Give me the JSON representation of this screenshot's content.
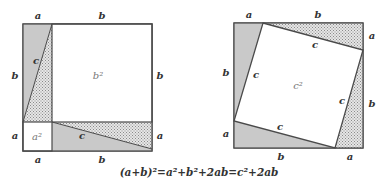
{
  "colors": {
    "stroke": "#4a4a4a",
    "solid_fill": "#c9c9c9",
    "dot_bg": "#e6e6e6",
    "dot_fg": "#8a8a8a",
    "label": "#333333"
  },
  "left_figure": {
    "labels": {
      "top_a": "a",
      "top_b": "b",
      "left_b": "b",
      "left_a": "a",
      "right_b": "b",
      "right_a": "a",
      "bottom_a": "a",
      "bottom_b": "b",
      "upper_c": "c",
      "lower_c": "c"
    },
    "areas": {
      "big_square": "b²",
      "small_square": "a²"
    }
  },
  "right_figure": {
    "labels": {
      "top_a": "a",
      "top_b": "b",
      "right_a": "a",
      "right_b": "b",
      "bottom_b": "b",
      "bottom_a": "a",
      "left_b": "b",
      "left_a": "a",
      "c_top": "c",
      "c_left": "c",
      "c_right": "c",
      "c_bottom": "c"
    },
    "areas": {
      "inner_square": "c²"
    }
  },
  "formula": "(a+b)²=a²+b²+2ab=c²+2ab"
}
